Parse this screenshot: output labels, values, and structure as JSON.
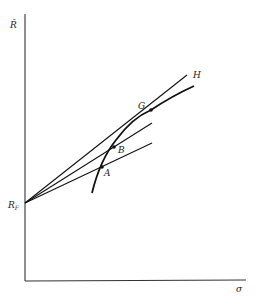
{
  "diagram": {
    "type": "efficient-frontier",
    "axes": {
      "y_label": "R̄",
      "x_label": "σ"
    },
    "intercept_label": "R",
    "intercept_subscript": "F",
    "points": [
      {
        "id": "A",
        "label": "A"
      },
      {
        "id": "B",
        "label": "B"
      },
      {
        "id": "G",
        "label": "G"
      }
    ],
    "lines": [
      {
        "from": "RF",
        "through": "A"
      },
      {
        "from": "RF",
        "through": "B"
      },
      {
        "from": "RF",
        "through": "G",
        "end_label": "H"
      }
    ],
    "end_label": "H"
  }
}
